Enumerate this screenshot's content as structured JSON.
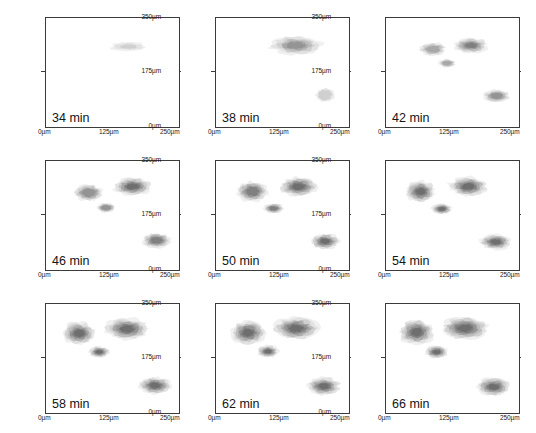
{
  "figure": {
    "type": "contour-panel-grid",
    "rows": 3,
    "cols": 3,
    "axis": {
      "x_ticks": [
        "0µm",
        "125µm",
        "250µm"
      ],
      "y_ticks": [
        "0µm",
        "175µm",
        "350µm"
      ],
      "xlim": [
        0,
        250
      ],
      "ylim": [
        0,
        350
      ],
      "x_unit": "µm",
      "y_unit": "µm"
    },
    "colors": {
      "background": "#ffffff",
      "axis": "#3b3b3b",
      "text": "#1a1a1a",
      "level_1": "#f0f0f0",
      "level_2": "#e2e2e2",
      "level_3": "#d0d0d0",
      "level_4": "#bdbdbd",
      "level_5": "#a8a8a8",
      "level_6": "#949494",
      "level_7": "#808080",
      "level_8": "#6e6e6e"
    }
  },
  "chart_data": {
    "type": "heatmap",
    "title": "",
    "xlabel": "",
    "ylabel": "",
    "xlim": [
      0,
      250
    ],
    "ylim": [
      0,
      350
    ],
    "grid": false,
    "legend": "none",
    "colormap": "grayscale-filled-contour",
    "contour_levels": [
      1,
      2,
      3,
      4,
      5,
      6,
      7,
      8
    ],
    "panels": [
      {
        "index": 0,
        "time_label": "34 min",
        "time_value": 34,
        "time_unit": "min",
        "max_level": 3,
        "features": [
          {
            "name": "main-cluster",
            "cx": 155,
            "cy": 258,
            "rx": 34,
            "ry": 14,
            "peak_level": 3
          },
          {
            "name": "satellite-blob",
            "present": false
          }
        ]
      },
      {
        "index": 1,
        "time_label": "38 min",
        "time_value": 38,
        "time_unit": "min",
        "max_level": 6,
        "features": [
          {
            "name": "main-cluster",
            "cx": 150,
            "cy": 262,
            "rx": 48,
            "ry": 30,
            "peak_level": 6
          },
          {
            "name": "satellite-blob",
            "cx": 205,
            "cy": 103,
            "rx": 17,
            "ry": 22,
            "peak_level": 3
          }
        ]
      },
      {
        "index": 2,
        "time_label": "42 min",
        "time_value": 42,
        "time_unit": "min",
        "max_level": 7,
        "features": [
          {
            "name": "main-cluster-left-lobe",
            "cx": 88,
            "cy": 250,
            "rx": 24,
            "ry": 20,
            "peak_level": 5
          },
          {
            "name": "main-cluster-right-lobe",
            "cx": 160,
            "cy": 262,
            "rx": 32,
            "ry": 24,
            "peak_level": 7
          },
          {
            "name": "lower-nodule",
            "cx": 115,
            "cy": 205,
            "rx": 16,
            "ry": 13,
            "peak_level": 5
          },
          {
            "name": "satellite-blob",
            "cx": 208,
            "cy": 100,
            "rx": 25,
            "ry": 20,
            "peak_level": 6
          }
        ]
      },
      {
        "index": 3,
        "time_label": "46 min",
        "time_value": 46,
        "time_unit": "min",
        "max_level": 8,
        "features": [
          {
            "name": "main-cluster-left-lobe",
            "cx": 80,
            "cy": 248,
            "rx": 26,
            "ry": 26,
            "peak_level": 6
          },
          {
            "name": "main-cluster-right-lobe",
            "cx": 163,
            "cy": 268,
            "rx": 34,
            "ry": 28,
            "peak_level": 8
          },
          {
            "name": "lower-nodule",
            "cx": 113,
            "cy": 200,
            "rx": 17,
            "ry": 15,
            "peak_level": 6
          },
          {
            "name": "satellite-blob",
            "cx": 208,
            "cy": 95,
            "rx": 26,
            "ry": 24,
            "peak_level": 7
          }
        ]
      },
      {
        "index": 4,
        "time_label": "50 min",
        "time_value": 50,
        "time_unit": "min",
        "max_level": 8,
        "features": [
          {
            "name": "main-cluster-left-lobe",
            "cx": 68,
            "cy": 252,
            "rx": 28,
            "ry": 32,
            "peak_level": 7
          },
          {
            "name": "main-cluster-right-lobe",
            "cx": 155,
            "cy": 268,
            "rx": 34,
            "ry": 30,
            "peak_level": 8
          },
          {
            "name": "lower-nodule",
            "cx": 108,
            "cy": 198,
            "rx": 18,
            "ry": 16,
            "peak_level": 7
          },
          {
            "name": "satellite-blob",
            "cx": 205,
            "cy": 92,
            "rx": 26,
            "ry": 25,
            "peak_level": 8
          }
        ]
      },
      {
        "index": 5,
        "time_label": "54 min",
        "time_value": 54,
        "time_unit": "min",
        "max_level": 8,
        "features": [
          {
            "name": "main-cluster-left-lobe",
            "cx": 65,
            "cy": 252,
            "rx": 28,
            "ry": 34,
            "peak_level": 8
          },
          {
            "name": "main-cluster-right-lobe",
            "cx": 155,
            "cy": 268,
            "rx": 36,
            "ry": 31,
            "peak_level": 8
          },
          {
            "name": "lower-nodule",
            "cx": 105,
            "cy": 196,
            "rx": 19,
            "ry": 17,
            "peak_level": 8
          },
          {
            "name": "satellite-blob",
            "cx": 206,
            "cy": 90,
            "rx": 29,
            "ry": 24,
            "peak_level": 8
          }
        ]
      },
      {
        "index": 6,
        "time_label": "58 min",
        "time_value": 58,
        "time_unit": "min",
        "max_level": 8,
        "features": [
          {
            "name": "main-cluster-left-lobe",
            "cx": 62,
            "cy": 256,
            "rx": 30,
            "ry": 36,
            "peak_level": 8
          },
          {
            "name": "main-cluster-right-lobe",
            "cx": 152,
            "cy": 270,
            "rx": 40,
            "ry": 34,
            "peak_level": 8
          },
          {
            "name": "lower-nodule",
            "cx": 100,
            "cy": 196,
            "rx": 19,
            "ry": 18,
            "peak_level": 8
          },
          {
            "name": "satellite-blob",
            "cx": 205,
            "cy": 88,
            "rx": 30,
            "ry": 27,
            "peak_level": 8
          }
        ]
      },
      {
        "index": 7,
        "time_label": "62 min",
        "time_value": 62,
        "time_unit": "min",
        "max_level": 8,
        "features": [
          {
            "name": "main-cluster-left-lobe",
            "cx": 60,
            "cy": 258,
            "rx": 31,
            "ry": 38,
            "peak_level": 8
          },
          {
            "name": "main-cluster-right-lobe",
            "cx": 150,
            "cy": 272,
            "rx": 41,
            "ry": 35,
            "peak_level": 8
          },
          {
            "name": "lower-nodule",
            "cx": 98,
            "cy": 198,
            "rx": 20,
            "ry": 19,
            "peak_level": 8
          },
          {
            "name": "satellite-blob",
            "cx": 203,
            "cy": 86,
            "rx": 31,
            "ry": 28,
            "peak_level": 8
          }
        ]
      },
      {
        "index": 8,
        "time_label": "66 min",
        "time_value": 66,
        "time_unit": "min",
        "max_level": 8,
        "features": [
          {
            "name": "main-cluster-left-lobe",
            "cx": 58,
            "cy": 260,
            "rx": 32,
            "ry": 40,
            "peak_level": 8
          },
          {
            "name": "main-cluster-right-lobe",
            "cx": 148,
            "cy": 272,
            "rx": 43,
            "ry": 36,
            "peak_level": 8
          },
          {
            "name": "lower-nodule",
            "cx": 95,
            "cy": 196,
            "rx": 21,
            "ry": 20,
            "peak_level": 8
          },
          {
            "name": "satellite-blob",
            "cx": 202,
            "cy": 84,
            "rx": 31,
            "ry": 29,
            "peak_level": 8
          }
        ]
      }
    ]
  }
}
